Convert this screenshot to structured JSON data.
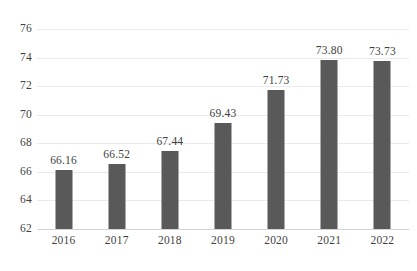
{
  "chart_data": {
    "type": "bar",
    "title": "",
    "subtitle": "",
    "xlabel": "",
    "ylabel": "",
    "categories": [
      "2016",
      "2017",
      "2018",
      "2019",
      "2020",
      "2021",
      "2022"
    ],
    "values": [
      66.16,
      66.52,
      67.44,
      69.43,
      71.73,
      73.8,
      73.73
    ],
    "value_labels": [
      "66.16",
      "66.52",
      "67.44",
      "69.43",
      "71.73",
      "73.80",
      "73.73"
    ],
    "ylim": [
      62,
      76
    ],
    "ytick_labels": [
      "62",
      "64",
      "66",
      "68",
      "70",
      "72",
      "74",
      "76"
    ],
    "ytick_values": [
      62,
      64,
      66,
      68,
      70,
      72,
      74,
      76
    ],
    "grid": true,
    "legend": false,
    "legend_position": "none",
    "bar_color": "#595959",
    "gridline_color": "#ebebeb",
    "axis_color": "#d4d4d4",
    "text_color": "#3f3f3f",
    "background_color": "#ffffff"
  }
}
